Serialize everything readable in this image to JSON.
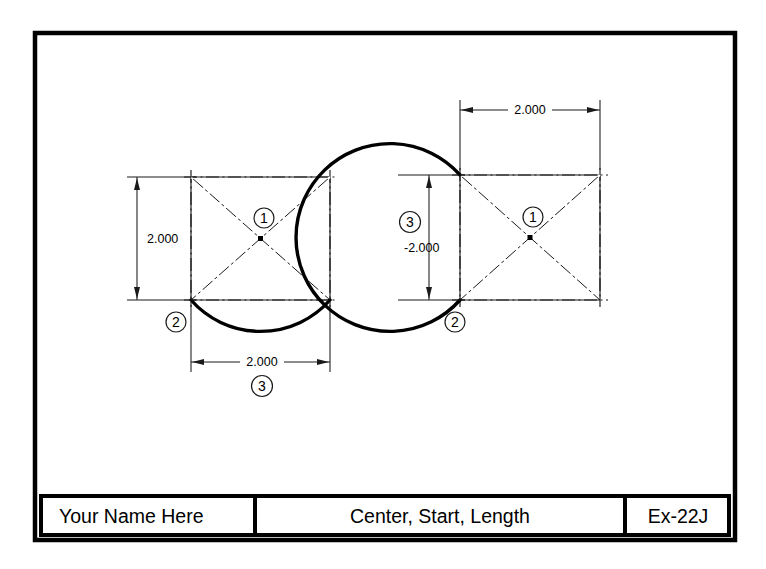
{
  "sheet": {
    "background_color": "#ffffff",
    "border_color": "#000000",
    "line_color": "#1a1a1a",
    "object_line_color": "#000000"
  },
  "title_block": {
    "name_cell": "Your Name Here",
    "description_cell": "Center, Start, Length",
    "exercise_cell": "Ex-22J"
  },
  "figures": [
    {
      "id": "left-figure",
      "name": "short-arc-figure",
      "balloons": [
        {
          "id": "1",
          "label": "1",
          "meaning": "center"
        },
        {
          "id": "2",
          "label": "2",
          "meaning": "start"
        },
        {
          "id": "3",
          "label": "3",
          "meaning": "length"
        }
      ],
      "dimensions": [
        {
          "id": "vertical",
          "value": "2.000",
          "orientation": "vertical"
        },
        {
          "id": "horizontal",
          "value": "2.000",
          "orientation": "horizontal"
        }
      ],
      "arc": {
        "direction": "counterclockwise",
        "sweep_deg": 90,
        "description": "short arc below square"
      }
    },
    {
      "id": "right-figure",
      "name": "long-arc-figure",
      "balloons": [
        {
          "id": "1",
          "label": "1",
          "meaning": "center"
        },
        {
          "id": "2",
          "label": "2",
          "meaning": "start"
        },
        {
          "id": "3",
          "label": "3",
          "meaning": "length"
        }
      ],
      "dimensions": [
        {
          "id": "horizontal",
          "value": "2.000",
          "orientation": "horizontal"
        },
        {
          "id": "vertical",
          "value": "-2.000",
          "orientation": "vertical"
        }
      ],
      "arc": {
        "direction": "clockwise",
        "sweep_deg": 270,
        "description": "long arc around square"
      }
    }
  ]
}
